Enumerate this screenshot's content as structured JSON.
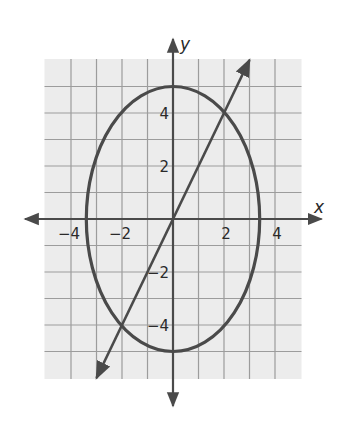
{
  "chart_data": {
    "type": "line",
    "title": "",
    "xlabel": "x",
    "ylabel": "y",
    "xlim": [
      -5,
      5
    ],
    "ylim": [
      -6,
      6
    ],
    "grid": true,
    "x_ticks": [
      -4,
      -2,
      2,
      4
    ],
    "y_ticks": [
      4,
      2,
      -2,
      -4
    ],
    "x_tick_labels": [
      "−4",
      "−2",
      "2",
      "4"
    ],
    "y_tick_labels": [
      "4",
      "2",
      "−2",
      "−4"
    ],
    "series": [
      {
        "name": "ellipse",
        "shape": "ellipse",
        "center": [
          0,
          0
        ],
        "semi_axis_x": 3.4,
        "semi_axis_y": 5,
        "color": "#4a4a4a"
      },
      {
        "name": "line",
        "shape": "line",
        "slope": 2,
        "intercept": 0,
        "x_range": [
          -3,
          3
        ],
        "arrows": "both",
        "color": "#4a4a4a",
        "intersections": [
          [
            2,
            4
          ],
          [
            -2,
            -4
          ]
        ]
      }
    ]
  },
  "colors": {
    "grid_bg": "#ececec",
    "grid_line": "#9c9c9c",
    "axis": "#4a4a4a",
    "curve": "#4a4a4a"
  }
}
